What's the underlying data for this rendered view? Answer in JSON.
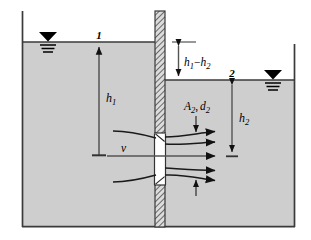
{
  "figure": {
    "name": "orifice-flow-diagram",
    "colors": {
      "water_fill": "#cecece",
      "outline": "#3a3a3a",
      "wall_hatch": "#555555",
      "wall_fill": "#d8d8d8",
      "orifice_fill": "#ffffff",
      "ink": "#000000"
    }
  },
  "labels": {
    "station_1": "1",
    "station_2": "2",
    "head_1": "h",
    "head_1_sub": "1",
    "head_2": "h",
    "head_2_sub": "2",
    "head_difference": "h₁ − h₂",
    "head_difference_parts": {
      "h": "h",
      "sub1": "1",
      "minus": "−",
      "sub2": "2"
    },
    "velocity": "v",
    "orifice_area": "A",
    "orifice_area_sub": "2",
    "orifice_diameter": "d",
    "orifice_diameter_sub": "2",
    "orifice_label": "A₂, d₂",
    "comma": ","
  },
  "geometry": {
    "left_wall_x": 22,
    "right_wall_x": 295,
    "bottom_y": 227,
    "left_surface_y": 42,
    "right_surface_y": 80,
    "divider_wall_x1": 155,
    "divider_wall_x2": 165,
    "divider_wall_top_y": 11,
    "orifice_top_y": 133,
    "orifice_bottom_y": 185,
    "centerline_y": 156
  },
  "annotations": {
    "water_surface_symbol": "filled-triangle-with-three-lines",
    "streamline_count": 5,
    "dimension_arrows": [
      "h1",
      "h2",
      "h1-h2"
    ],
    "flow_direction": "left-to-right"
  }
}
